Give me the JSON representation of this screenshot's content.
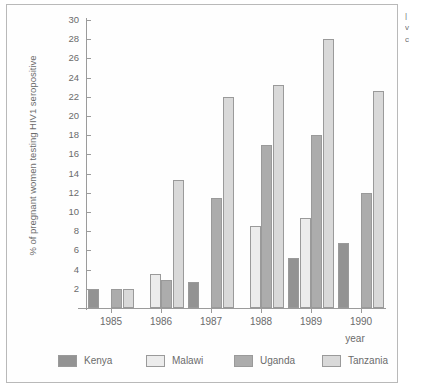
{
  "chart_data": {
    "type": "bar",
    "title": "",
    "xlabel": "year",
    "ylabel": "% of pregnant women testing HIV1 seropositive",
    "ylim": [
      0,
      30
    ],
    "ytick_step": 2,
    "yticks": [
      2,
      4,
      6,
      8,
      10,
      12,
      14,
      16,
      18,
      20,
      22,
      24,
      26,
      28,
      30
    ],
    "categories": [
      "1985",
      "1986",
      "1987",
      "1988",
      "1989",
      "1990"
    ],
    "grid": false,
    "legend_position": "bottom",
    "series": [
      {
        "name": "Kenya",
        "color": "#939393",
        "values": [
          2.0,
          null,
          2.7,
          null,
          5.2,
          6.8
        ]
      },
      {
        "name": "Malawi",
        "color": "#ececec",
        "values": [
          null,
          3.5,
          null,
          8.5,
          9.4,
          null
        ]
      },
      {
        "name": "Uganda",
        "color": "#acacac",
        "values": [
          2.0,
          2.9,
          11.5,
          17.0,
          18.0,
          12.0
        ]
      },
      {
        "name": "Tanzania",
        "color": "#d9d9d9",
        "values": [
          2.0,
          13.3,
          22.0,
          23.2,
          28.0,
          22.6
        ]
      }
    ]
  },
  "edge_text": [
    "|",
    "v",
    "c"
  ]
}
